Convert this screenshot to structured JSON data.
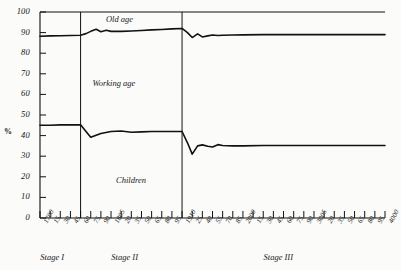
{
  "chart_data": {
    "type": "line",
    "title": "",
    "subtitle": "",
    "xlabel": "",
    "ylabel": "%",
    "ylim": [
      0,
      100
    ],
    "xlim": [
      1700,
      4000
    ],
    "grid": false,
    "legend_position": "inline-annotations",
    "y_ticks": [
      0,
      10,
      20,
      30,
      40,
      50,
      60,
      70,
      80,
      90,
      100
    ],
    "y_tick_labels": [
      "0",
      "10",
      "20",
      "30",
      "40",
      "50",
      "60",
      "70",
      "80",
      "90",
      "100"
    ],
    "x_tick_labels": [
      "1700",
      "15",
      "30",
      "45",
      "60",
      "75",
      "90",
      "1805",
      "20",
      "35",
      "50",
      "65",
      "80",
      "95",
      "1910",
      "25",
      "40",
      "55",
      "70",
      "85",
      "2000",
      "15",
      "30",
      "45",
      "60",
      "75",
      "90",
      "3005",
      "20",
      "35",
      "50",
      "65",
      "80",
      "95",
      "4000"
    ],
    "x_tick_values": [
      1700,
      1715,
      1730,
      1745,
      1760,
      1775,
      1790,
      1805,
      1820,
      1835,
      1850,
      1865,
      1880,
      1895,
      1910,
      1925,
      1940,
      1955,
      1970,
      1985,
      2000,
      2015,
      2030,
      2045,
      2060,
      2075,
      2090,
      3005,
      3020,
      3035,
      3050,
      3065,
      3080,
      3095,
      4000
    ],
    "band_labels": [
      "Old age",
      "Working age",
      "Children"
    ],
    "stage_labels": [
      "Stage I",
      "Stage II",
      "Stage III"
    ],
    "stage_boundaries": [
      1760,
      1910
    ],
    "annotations": [
      {
        "text": "Old age",
        "x": 1830,
        "y": 96
      },
      {
        "text": "Working age",
        "x": 1810,
        "y": 65
      },
      {
        "text": "Children",
        "x": 1845,
        "y": 18
      }
    ],
    "series": [
      {
        "name": "Children upper boundary (cumulative % children)",
        "x": [
          1700,
          1715,
          1730,
          1745,
          1760,
          1768,
          1775,
          1790,
          1805,
          1820,
          1835,
          1850,
          1865,
          1880,
          1895,
          1910,
          1918,
          1925,
          1933,
          1940,
          1948,
          1955,
          1963,
          1970,
          1985,
          2000,
          2030,
          2060,
          2090,
          3050,
          4000
        ],
        "values": [
          45.0,
          45.0,
          45.2,
          45.2,
          45.3,
          42.0,
          39.2,
          41.0,
          42.0,
          42.2,
          41.6,
          41.8,
          42.0,
          42.0,
          42.0,
          42.0,
          36.5,
          31.0,
          35.0,
          35.5,
          34.8,
          34.5,
          35.6,
          35.2,
          35.0,
          35.0,
          35.2,
          35.2,
          35.2,
          35.2,
          35.2
        ]
      },
      {
        "name": "Working age upper boundary (cumulative % children + working age)",
        "x": [
          1700,
          1715,
          1730,
          1745,
          1760,
          1768,
          1775,
          1783,
          1790,
          1798,
          1805,
          1820,
          1835,
          1850,
          1865,
          1880,
          1895,
          1910,
          1918,
          1925,
          1933,
          1940,
          1948,
          1955,
          1963,
          1970,
          1985,
          2000,
          2030,
          2060,
          2090,
          3050,
          4000
        ],
        "values": [
          88.2,
          88.4,
          88.5,
          88.6,
          88.7,
          89.5,
          90.6,
          91.6,
          90.4,
          91.1,
          90.6,
          90.6,
          90.8,
          91.0,
          91.3,
          91.5,
          91.8,
          92.0,
          90.0,
          87.6,
          89.4,
          87.9,
          88.4,
          88.8,
          88.6,
          88.7,
          88.8,
          88.9,
          89.0,
          89.0,
          89.0,
          89.0,
          89.0
        ]
      }
    ]
  },
  "axis": {
    "percent_symbol": "%"
  }
}
